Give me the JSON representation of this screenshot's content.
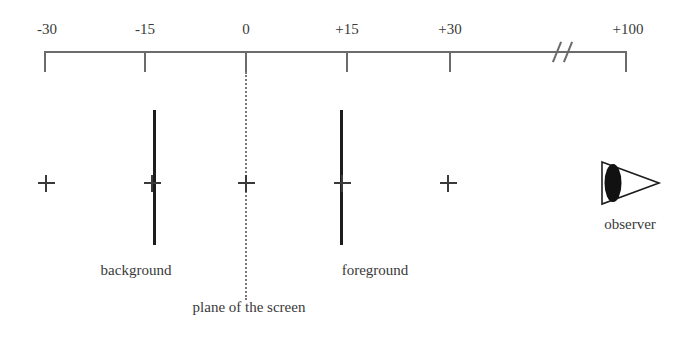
{
  "figure": {
    "type": "depth-axis-diagram",
    "background_color": "#ffffff",
    "line_color": "#6b6b6b",
    "bar_color": "#1c1c1c",
    "text_color": "#3a3a3a"
  },
  "axis": {
    "name": "disparity-axis",
    "ticks": [
      {
        "label": "-30",
        "value": -30,
        "x": 45
      },
      {
        "label": "-15",
        "value": -15,
        "x": 145
      },
      {
        "label": "0",
        "value": 0,
        "x": 246
      },
      {
        "label": "+15",
        "value": 15,
        "x": 347
      },
      {
        "label": "+30",
        "value": 30,
        "x": 450
      },
      {
        "label": "+100",
        "value": 100,
        "x": 626
      }
    ],
    "break_symbol": "//"
  },
  "markers": {
    "crosshair_symbol": "+",
    "crosshairs": [
      {
        "name": "crosshair-minus-30",
        "x": 46,
        "y": 183
      },
      {
        "name": "crosshair-minus-15",
        "x": 152,
        "y": 183
      },
      {
        "name": "crosshair-zero",
        "x": 246,
        "y": 183
      },
      {
        "name": "crosshair-plus-15",
        "x": 342,
        "y": 183
      },
      {
        "name": "crosshair-plus-30",
        "x": 448,
        "y": 183
      }
    ]
  },
  "bars": [
    {
      "name": "background-bar",
      "label": "background",
      "x": 154,
      "top": 110,
      "bottom": 245,
      "label_x": 136,
      "label_y": 262
    },
    {
      "name": "foreground-bar",
      "label": "foreground",
      "x": 341,
      "top": 110,
      "bottom": 245,
      "label_x": 375,
      "label_y": 262
    }
  ],
  "screen_plane": {
    "label": "plane of the screen",
    "x": 246,
    "top": 55,
    "bottom": 300,
    "label_x": 249,
    "label_y": 299
  },
  "observer": {
    "label": "observer",
    "icon": "eye-icon",
    "label_x": 630,
    "label_y": 216
  }
}
